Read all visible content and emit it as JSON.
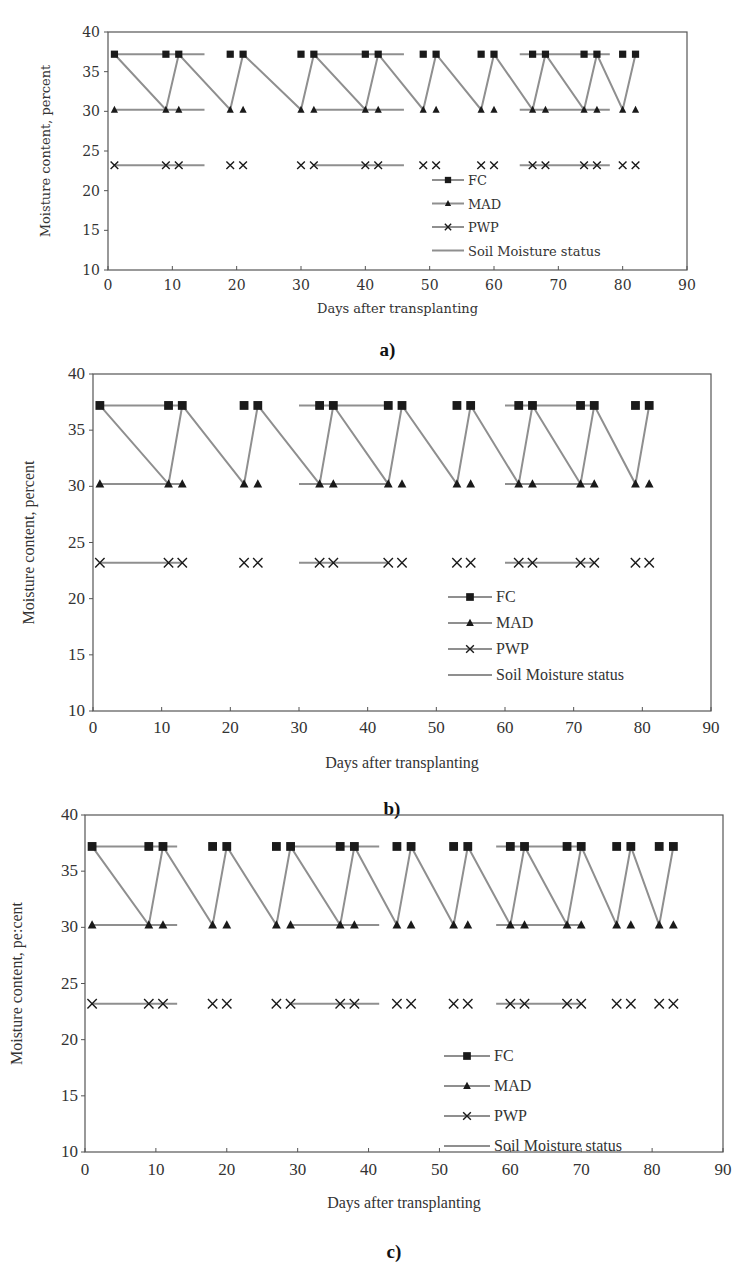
{
  "colors": {
    "line": "#8f8f8f",
    "marker": "#1a1a1a",
    "axis": "#555555",
    "text": "#333333"
  },
  "chart_data": [
    {
      "type": "line",
      "caption": "a)",
      "title": "",
      "xlabel": "Days after transplanting",
      "ylabel": "Moisture content, percent",
      "xlim": [
        0,
        90
      ],
      "ylim": [
        10,
        40
      ],
      "xticks": [
        "0",
        "10",
        "20",
        "30",
        "40",
        "50",
        "60",
        "70",
        "80",
        "90"
      ],
      "yticks": [
        "10",
        "15",
        "20",
        "25",
        "30",
        "35",
        "40"
      ],
      "grid": false,
      "legend_position": "bottom-right-inside",
      "legend": [
        "FC",
        "MAD",
        "PWP",
        "Soil Moisture status"
      ],
      "levels": {
        "FC": 37.2,
        "MAD": 30.2,
        "PWP": 23.2
      },
      "marker_days": [
        1,
        9,
        11,
        19,
        21,
        30,
        32,
        40,
        42,
        49,
        51,
        58,
        60,
        66,
        68,
        74,
        76,
        80,
        82
      ],
      "level_line_segments": [
        [
          1,
          15
        ],
        [
          32,
          46
        ],
        [
          64,
          78
        ]
      ],
      "series": [
        {
          "name": "FC",
          "marker": "square",
          "y": 37.2
        },
        {
          "name": "MAD",
          "marker": "triangle",
          "y": 30.2
        },
        {
          "name": "PWP",
          "marker": "cross",
          "y": 23.2
        },
        {
          "name": "Soil Moisture status",
          "x": [
            1,
            9,
            11,
            19,
            21,
            30,
            32,
            40,
            42,
            49,
            51,
            58,
            60,
            66,
            68,
            74,
            76,
            80,
            82
          ],
          "values": [
            37.2,
            30.2,
            37.2,
            30.2,
            37.2,
            30.2,
            37.2,
            30.2,
            37.2,
            30.2,
            37.2,
            30.2,
            37.2,
            30.2,
            37.2,
            30.2,
            37.2,
            30.2,
            37.2
          ]
        }
      ]
    },
    {
      "type": "line",
      "caption": "b)",
      "title": "",
      "xlabel": "Days after transplanting",
      "ylabel": "Moisture content, percent",
      "xlim": [
        0,
        90
      ],
      "ylim": [
        10,
        40
      ],
      "xticks": [
        "0",
        "10",
        "20",
        "30",
        "40",
        "50",
        "60",
        "70",
        "80",
        "90"
      ],
      "yticks": [
        "10",
        "15",
        "20",
        "25",
        "30",
        "35",
        "40"
      ],
      "grid": false,
      "legend_position": "bottom-right-inside",
      "legend": [
        "FC",
        "MAD",
        "PWP",
        "Soil Moisture status"
      ],
      "levels": {
        "FC": 37.2,
        "MAD": 30.2,
        "PWP": 23.2
      },
      "marker_days": [
        1,
        11,
        13,
        22,
        24,
        33,
        35,
        43,
        45,
        53,
        55,
        62,
        64,
        71,
        73,
        79,
        81
      ],
      "level_line_segments": [
        [
          1,
          13
        ],
        [
          30,
          43
        ],
        [
          60,
          73
        ]
      ],
      "series": [
        {
          "name": "FC",
          "marker": "square",
          "y": 37.2
        },
        {
          "name": "MAD",
          "marker": "triangle",
          "y": 30.2
        },
        {
          "name": "PWP",
          "marker": "cross",
          "y": 23.2
        },
        {
          "name": "Soil Moisture status",
          "x": [
            1,
            11,
            13,
            22,
            24,
            33,
            35,
            43,
            45,
            53,
            55,
            62,
            64,
            71,
            73,
            79,
            81
          ],
          "values": [
            37.2,
            30.2,
            37.2,
            30.2,
            37.2,
            30.2,
            37.2,
            30.2,
            37.2,
            30.2,
            37.2,
            30.2,
            37.2,
            30.2,
            37.2,
            30.2,
            37.2
          ]
        }
      ]
    },
    {
      "type": "line",
      "caption": "c)",
      "title": "",
      "xlabel": "Days after transplanting",
      "ylabel": "Moisture content, pe:cent",
      "xlim": [
        0,
        90
      ],
      "ylim": [
        10,
        40
      ],
      "xticks": [
        "0",
        "10",
        "20",
        "30",
        "40",
        "50",
        "60",
        "70",
        "80",
        "90"
      ],
      "yticks": [
        "10",
        "15",
        "20",
        "25",
        "30",
        "35",
        "40"
      ],
      "grid": false,
      "legend_position": "bottom-right-inside",
      "legend": [
        "FC",
        "MAD",
        "PWP",
        "Soil Moisture status"
      ],
      "levels": {
        "FC": 37.2,
        "MAD": 30.2,
        "PWP": 23.2
      },
      "marker_days": [
        1,
        9,
        11,
        18,
        20,
        27,
        29,
        36,
        38,
        44,
        46,
        52,
        54,
        60,
        62,
        68,
        70,
        75,
        77,
        81,
        83
      ],
      "level_line_segments": [
        [
          1,
          13
        ],
        [
          29,
          41.5
        ],
        [
          58,
          70
        ]
      ],
      "series": [
        {
          "name": "FC",
          "marker": "square",
          "y": 37.2
        },
        {
          "name": "MAD",
          "marker": "triangle",
          "y": 30.2
        },
        {
          "name": "PWP",
          "marker": "cross",
          "y": 23.2
        },
        {
          "name": "Soil Moisture status",
          "x": [
            1,
            9,
            11,
            18,
            20,
            27,
            29,
            36,
            38,
            44,
            46,
            52,
            54,
            60,
            62,
            68,
            70,
            75,
            77,
            81,
            83
          ],
          "values": [
            37.2,
            30.2,
            37.2,
            30.2,
            37.2,
            30.2,
            37.2,
            30.2,
            37.2,
            30.2,
            37.2,
            30.2,
            37.2,
            30.2,
            37.2,
            30.2,
            37.2,
            30.2,
            37.2,
            30.2,
            37.2
          ]
        }
      ]
    }
  ]
}
